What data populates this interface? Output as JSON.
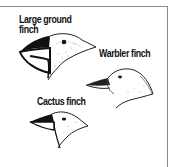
{
  "figure": {
    "labels": {
      "large_ground_line1": "Large ground",
      "large_ground_line2": "finch",
      "warbler": "Warbler finch",
      "cactus": "Cactus finch"
    },
    "colors": {
      "frame": "#8a8a8a",
      "ink": "#111111",
      "background": "#ffffff"
    }
  }
}
